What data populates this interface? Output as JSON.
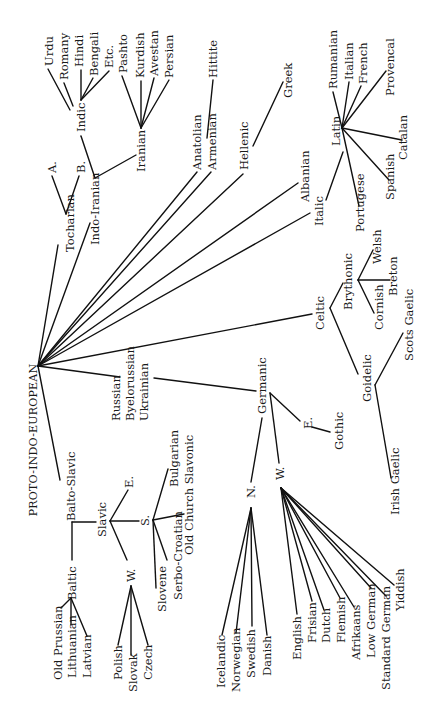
{
  "diagram": {
    "orientation": "rotated-90-ccw",
    "root": "PROTO-INDO-EUROPEAN",
    "colors": {
      "background": "#ffffff",
      "ink": "#111111"
    },
    "nodes": {
      "pie": "PROTO-INDO-EUROPEAN",
      "tocharian": "Tocharian",
      "toch_a": "A.",
      "toch_b": "B.",
      "indo_iranian": "Indo-Iranian",
      "indic": "Indic",
      "urdu": "Urdu",
      "romany": "Romany",
      "hindi": "Hindi",
      "bengali": "Bengali",
      "etc": "Etc.",
      "iranian": "Iranian",
      "pashto": "Pashto",
      "kurdish": "Kurdish",
      "avestan": "Avestan",
      "persian": "Persian",
      "anatolian": "Anatolian",
      "hittite": "Hittite",
      "armenian": "Armenian",
      "hellenic": "Hellenic",
      "greek": "Greek",
      "albanian": "Albanian",
      "italic": "Italic",
      "latin": "Latin",
      "rumanian": "Rumanian",
      "italian": "Italian",
      "french": "French",
      "provencal": "Provencal",
      "catalan": "Catalan",
      "spanish": "Spanish",
      "portugese": "Portugese",
      "celtic": "Celtic",
      "brythonic": "Brythonic",
      "welsh": "Welsh",
      "breton": "Breton",
      "cornish": "Cornish",
      "goidelic": "Goidelic",
      "scots_gaelic": "Scots Gaelic",
      "irish_gaelic": "Irish Gaelic",
      "germanic": "Germanic",
      "germ_e": "E.",
      "gothic": "Gothic",
      "germ_n": "N.",
      "icelandic": "Icelandic",
      "norwegian": "Norwegian",
      "swedish": "Swedish",
      "danish": "Danish",
      "germ_w": "W.",
      "english": "English",
      "frisian": "Frisian",
      "dutch": "Dutch",
      "flemish": "Flemish",
      "afrikaans": "Afrikaans",
      "low_german": "Low German",
      "standard_german": "Standard German",
      "yiddish": "Yiddish",
      "balto_slavic": "Balto-Slavic",
      "baltic": "Baltic",
      "old_prussian": "Old Prussian",
      "lithuanian": "Lithuanian",
      "latvian": "Latvian",
      "slavic": "Slavic",
      "slav_e": "E.",
      "russian": "Russian",
      "byelorussian": "Byelorussian",
      "ukrainian": "Ukrainian",
      "slav_s": "S.",
      "bulgarian": "Bulgarian",
      "old_church_slavonic": "Old Church Slavonic",
      "serbo_croatian": "Serbo-Croatian",
      "slovene": "Slovene",
      "slav_w": "W.",
      "polish": "Polish",
      "slovak": "Slovak",
      "czech": "Czech"
    },
    "hierarchy": [
      {
        "name": "Tocharian",
        "children": [
          "A.",
          "B."
        ]
      },
      {
        "name": "Indo-Iranian",
        "children": [
          {
            "name": "Indic",
            "children": [
              "Urdu",
              "Romany",
              "Hindi",
              "Bengali",
              "Etc."
            ]
          },
          {
            "name": "Iranian",
            "children": [
              "Pashto",
              "Kurdish",
              "Avestan",
              "Persian"
            ]
          }
        ]
      },
      {
        "name": "Anatolian",
        "children": [
          "Hittite"
        ]
      },
      {
        "name": "Armenian",
        "children": []
      },
      {
        "name": "Hellenic",
        "children": [
          "Greek"
        ]
      },
      {
        "name": "Albanian",
        "children": []
      },
      {
        "name": "Italic",
        "children": [
          {
            "name": "Latin",
            "children": [
              "Rumanian",
              "Italian",
              "French",
              "Provencal",
              "Catalan",
              "Spanish",
              "Portugese"
            ]
          }
        ]
      },
      {
        "name": "Celtic",
        "children": [
          {
            "name": "Brythonic",
            "children": [
              "Welsh",
              "Breton",
              "Cornish"
            ]
          },
          {
            "name": "Goidelic",
            "children": [
              "Scots Gaelic",
              "Irish Gaelic"
            ]
          }
        ]
      },
      {
        "name": "Germanic",
        "children": [
          {
            "name": "E.",
            "children": [
              "Gothic"
            ]
          },
          {
            "name": "N.",
            "children": [
              "Icelandic",
              "Norwegian",
              "Swedish",
              "Danish"
            ]
          },
          {
            "name": "W.",
            "children": [
              "English",
              "Frisian",
              "Dutch",
              "Flemish",
              "Afrikaans",
              "Low German",
              "Standard German",
              "Yiddish"
            ]
          }
        ]
      },
      {
        "name": "Balto-Slavic",
        "children": [
          {
            "name": "Baltic",
            "children": [
              "Old Prussian",
              "Lithuanian",
              "Latvian"
            ]
          },
          {
            "name": "Slavic",
            "children": [
              {
                "name": "E.",
                "children": [
                  "Russian",
                  "Byelorussian",
                  "Ukrainian"
                ]
              },
              {
                "name": "S.",
                "children": [
                  "Bulgarian",
                  "Old Church Slavonic",
                  "Serbo-Croatian",
                  "Slovene"
                ]
              },
              {
                "name": "W.",
                "children": [
                  "Polish",
                  "Slovak",
                  "Czech"
                ]
              }
            ]
          }
        ]
      }
    ]
  }
}
